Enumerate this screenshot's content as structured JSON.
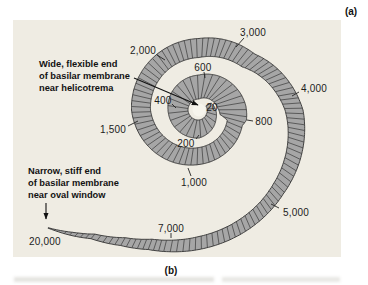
{
  "figure": {
    "title_semantic": "Unrolled cochlea frequency map of the basilar membrane",
    "subfigure_labels": {
      "a": "(a)",
      "b": "(b)"
    },
    "annotations": {
      "helicotrema": {
        "lines": [
          "Wide, flexible end",
          "of basilar membrane",
          "near helicotrema"
        ]
      },
      "oval_window": {
        "lines": [
          "Narrow, stiff end",
          "of basilar membrane",
          "near oval window"
        ]
      }
    },
    "frequency_labels": [
      {
        "text": "20",
        "hz": 20,
        "x": 212,
        "y": 107,
        "tick": null
      },
      {
        "text": "200",
        "hz": 200,
        "x": 186,
        "y": 143,
        "tick": [
          196,
          139,
          199,
          135
        ]
      },
      {
        "text": "400",
        "hz": 400,
        "x": 163,
        "y": 100,
        "tick": [
          172,
          104,
          176,
          108
        ]
      },
      {
        "text": "600",
        "hz": 600,
        "x": 203,
        "y": 67,
        "tick": [
          204,
          72,
          205,
          78
        ]
      },
      {
        "text": "800",
        "hz": 800,
        "x": 264,
        "y": 121,
        "tick": [
          253,
          121,
          247,
          120
        ]
      },
      {
        "text": "1,000",
        "hz": 1000,
        "x": 194,
        "y": 182,
        "tick": [
          191,
          176,
          188,
          168
        ]
      },
      {
        "text": "1,500",
        "hz": 1500,
        "x": 113,
        "y": 129,
        "tick": [
          128,
          126,
          138,
          121
        ]
      },
      {
        "text": "2,000",
        "hz": 2000,
        "x": 143,
        "y": 50,
        "tick": [
          157,
          55,
          165,
          60
        ]
      },
      {
        "text": "3,000",
        "hz": 3000,
        "x": 253,
        "y": 32,
        "tick": [
          244,
          38,
          236,
          47
        ]
      },
      {
        "text": "4,000",
        "hz": 4000,
        "x": 314,
        "y": 88,
        "tick": [
          299,
          92,
          292,
          96
        ]
      },
      {
        "text": "5,000",
        "hz": 5000,
        "x": 296,
        "y": 212,
        "tick": [
          279,
          208,
          271,
          204
        ]
      },
      {
        "text": "7,000",
        "hz": 7000,
        "x": 171,
        "y": 228,
        "tick": [
          171,
          233,
          171,
          238
        ]
      },
      {
        "text": "20,000",
        "hz": 20000,
        "x": 45,
        "y": 241,
        "tick": null
      }
    ],
    "spiral": {
      "cx": 199,
      "cy": 110,
      "hole_radius": 6.5,
      "rung_spacing": 5,
      "control_points": [
        [
          -30,
          11,
          6
        ],
        [
          30,
          14,
          11
        ],
        [
          90,
          19,
          18
        ],
        [
          180,
          21,
          20
        ],
        [
          270,
          23,
          24
        ],
        [
          355,
          33,
          28
        ],
        [
          372,
          35,
          27
        ],
        [
          380,
          38,
          16
        ],
        [
          450,
          46,
          17
        ],
        [
          540,
          58,
          19
        ],
        [
          630,
          62,
          19
        ],
        [
          675,
          70,
          18
        ],
        [
          720,
          95,
          18
        ],
        [
          765,
          112,
          14
        ],
        [
          810,
          133,
          13
        ],
        [
          820,
          138,
          12
        ],
        [
          830,
          143,
          11
        ],
        [
          840,
          152,
          9
        ],
        [
          850,
          165,
          6
        ],
        [
          856,
          178,
          4
        ],
        [
          862,
          191.5,
          0.5
        ]
      ]
    },
    "colors": {
      "page": "#ffffff",
      "panel": "#efece3",
      "band": "#a6a6a6",
      "outline": "#333333",
      "rung": "#3a3a3a",
      "hole": "#f6f4ec",
      "text": "#1c1c1c",
      "arrow": "#111111"
    },
    "panel": {
      "x": 13,
      "y": 20,
      "width": 328,
      "height": 237
    }
  }
}
